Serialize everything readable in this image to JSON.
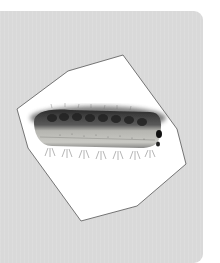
{
  "image": {
    "subject": "caterpillar",
    "alt": "Photo of a hairy caterpillar on white background, cut out in a polygon shape",
    "panel_color": "#d9d9d9",
    "polygon_fill": "#ffffff",
    "polygon_stroke": "#555555",
    "polygon_points": "17,109 68,71 123,55 177,129 186,164 137,206 81,221 28,148"
  }
}
